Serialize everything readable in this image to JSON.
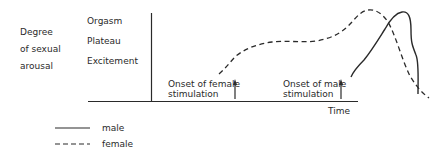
{
  "diagram": {
    "y_axis_title": [
      "Degree",
      "of sexual",
      "arousal"
    ],
    "y_levels": [
      "Orgasm",
      "Plateau",
      "Excitement"
    ],
    "x_axis_title": "Time",
    "annotations": {
      "female_onset": [
        "Onset of female",
        "stimulation"
      ],
      "male_onset": [
        "Onset of male",
        "stimulation"
      ]
    },
    "legend": [
      {
        "label": "male",
        "style": "solid"
      },
      {
        "label": "female",
        "style": "dashed"
      }
    ],
    "colors": {
      "ink": "#2a2a2a",
      "background": "#ffffff"
    }
  }
}
